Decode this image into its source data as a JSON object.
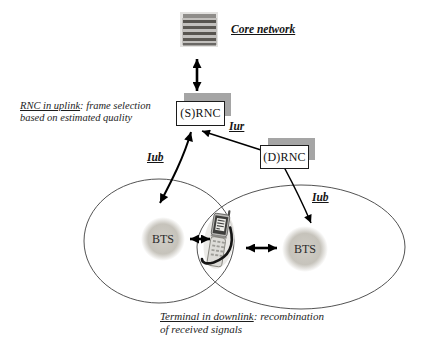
{
  "nodes": {
    "core_network": {
      "label": "Core network",
      "icon": "server-stack-icon"
    },
    "srnc": {
      "label": "(S)RNC"
    },
    "drnc": {
      "label": "(D)RNC"
    },
    "bts_left": {
      "label": "BTS"
    },
    "bts_right": {
      "label": "BTS"
    },
    "terminal": {
      "icon": "mobile-phone-icon"
    }
  },
  "interface_labels": {
    "iur": "Iur",
    "iub_left": "Iub",
    "iub_right": "Iub"
  },
  "annotations": {
    "rnc_uplink": {
      "underlined": "RNC in uplink",
      "line1_rest": ": frame selection",
      "line2": "based on estimated quality"
    },
    "terminal_downlink": {
      "underlined": "Terminal in downlink",
      "line1_rest": ": recombination",
      "line2": "of received signals"
    }
  },
  "colors": {
    "background": "#ffffff",
    "box_shadow_gray": "#a5a5a5",
    "bts_fill": "#c8c5bd",
    "cell_outline": "#3f3f3f",
    "arrow": "#000000"
  }
}
